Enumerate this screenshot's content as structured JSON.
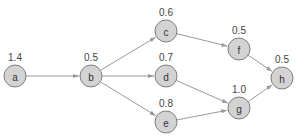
{
  "diagram": {
    "type": "directed-graph",
    "colors": {
      "node_fill": "#d3d3d3",
      "node_stroke": "#7f7f7f",
      "edge": "#9a9a9a",
      "text": "#333333"
    },
    "nodes": [
      {
        "id": "a",
        "label": "a",
        "weight": "1.4",
        "x": 15,
        "y": 76
      },
      {
        "id": "b",
        "label": "b",
        "weight": "0.5",
        "x": 91,
        "y": 76
      },
      {
        "id": "c",
        "label": "c",
        "weight": "0.6",
        "x": 166,
        "y": 31
      },
      {
        "id": "d",
        "label": "d",
        "weight": "0.7",
        "x": 166,
        "y": 76
      },
      {
        "id": "e",
        "label": "e",
        "weight": "0.8",
        "x": 166,
        "y": 122
      },
      {
        "id": "f",
        "label": "f",
        "weight": "0.5",
        "x": 239,
        "y": 49
      },
      {
        "id": "g",
        "label": "g",
        "weight": "1.0",
        "x": 239,
        "y": 108
      },
      {
        "id": "h",
        "label": "h",
        "weight": "0.5",
        "x": 282,
        "y": 78
      }
    ],
    "edges": [
      {
        "from": "a",
        "to": "b"
      },
      {
        "from": "b",
        "to": "c"
      },
      {
        "from": "b",
        "to": "d"
      },
      {
        "from": "b",
        "to": "e"
      },
      {
        "from": "c",
        "to": "f"
      },
      {
        "from": "d",
        "to": "g"
      },
      {
        "from": "e",
        "to": "g"
      },
      {
        "from": "f",
        "to": "h"
      },
      {
        "from": "g",
        "to": "h"
      }
    ]
  }
}
